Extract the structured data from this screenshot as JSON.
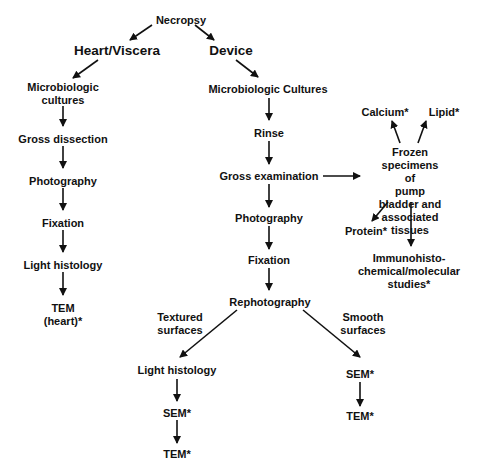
{
  "diagram": {
    "root": "Necropsy",
    "branches": {
      "heart": {
        "title": "Heart/Viscera",
        "steps": [
          "Microbiologic\ncultures",
          "Gross dissection",
          "Photography",
          "Fixation",
          "Light histology",
          "TEM\n(heart)*"
        ]
      },
      "device": {
        "title": "Device",
        "steps": [
          "Microbiologic Cultures",
          "Rinse",
          "Gross examination",
          "Photography",
          "Fixation",
          "Rephotography"
        ],
        "textured": {
          "label": "Textured\nsurfaces",
          "steps": [
            "Light histology",
            "SEM*",
            "TEM*"
          ]
        },
        "smooth": {
          "label": "Smooth\nsurfaces",
          "steps": [
            "SEM*",
            "TEM*"
          ]
        }
      },
      "frozen": {
        "title": "Frozen\nspecimens of\npump bladder and\nassociated\ntissues",
        "outputs": [
          "Calcium*",
          "Lipid*",
          "Protein*",
          "Immunohisto-\nchemical/molecular\nstudies*"
        ]
      }
    }
  },
  "colors": {
    "line": "#111111",
    "background": "#ffffff"
  }
}
